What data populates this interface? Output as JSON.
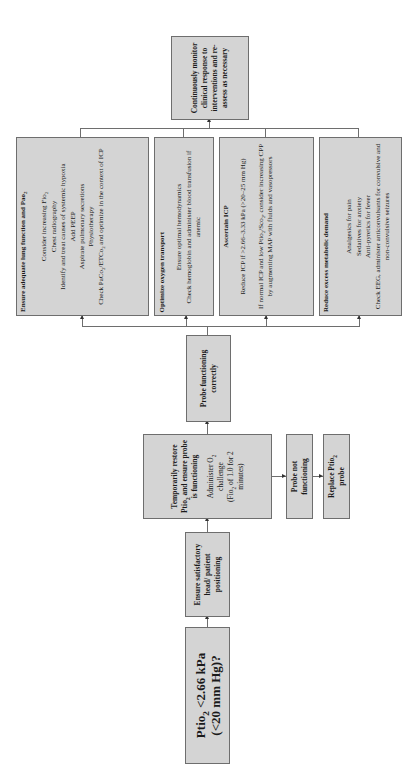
{
  "flowchart": {
    "start": {
      "line1": "Ptio",
      "line1_sub": "2",
      "line1_rest": " <2.66 kPa",
      "line2": "(<20 mm Hg)?"
    },
    "positioning": {
      "text": "Ensure satisfactory head/ patient positioning"
    },
    "restore": {
      "title_a": "Temporarily restore Ptio",
      "title_sub": "2",
      "title_b": " and ensure probe is functioning",
      "body_a": "Administer O",
      "body_sub": "2",
      "body_b": " challenge",
      "body_c": "(Fio",
      "body_c_sub": "2",
      "body_c_rest": " of 1.0 for 2 minutes)"
    },
    "probe_not_functioning": {
      "text": "Probe not functioning"
    },
    "replace_probe": {
      "text_a": "Replace Ptio",
      "text_sub": "2",
      "text_b": " probe"
    },
    "probe_ok": {
      "text": "Probe functioning correctly"
    },
    "lung": {
      "title_a": "Ensure adequate lung function and Pao",
      "title_sub": "2",
      "items": [
        {
          "a": "Consider increasing Fio",
          "sub": "2",
          "b": ""
        },
        {
          "a": "Chest radiography",
          "sub": "",
          "b": ""
        },
        {
          "a": "Identify and treat causes of systemic hypoxia",
          "sub": "",
          "b": ""
        },
        {
          "a": "Add PEEP",
          "sub": "",
          "b": ""
        },
        {
          "a": "Aspirate pulmonary secretions",
          "sub": "",
          "b": ""
        },
        {
          "a": "Physiotherapy",
          "sub": "",
          "b": ""
        }
      ],
      "last_a": "Check PaCo",
      "last_sub1": "2",
      "last_b": "/ETCo",
      "last_sub2": "2",
      "last_c": " and optimize in the context of ICP"
    },
    "oxygen": {
      "title": "Optimize oxygen transport",
      "items": [
        "Ensure optimal hemodynamics",
        "Check hemoglobin and administer blood transfusion if anemic"
      ]
    },
    "icp": {
      "title": "Ascertain ICP",
      "item1": "Reduce ICP if >2.66–3.33 kPa (>20–25 mm Hg)",
      "item2_a": "If normal ICP and low Ptio",
      "item2_sub": "2",
      "item2_b": "/Sco",
      "item2_sub2": "2",
      "item2_c": ", consider increasing CPP by augmenting MAP with fluids and vasopressors"
    },
    "metabolic": {
      "title": "Reduce excess metabolic demand",
      "items": [
        "Analgesics for pain",
        "Sedatives for anxiety",
        "Anti-pyretics for fever",
        "Check EEG, administer anticonvulsants for convulsive and non-convulsive seizures"
      ]
    },
    "monitor": {
      "text": "Continuously monitor clinical response to interventions and re-assess as necessary"
    }
  },
  "colors": {
    "box_fill": "#d4d4d4",
    "box_border": "#6e6e6e",
    "text": "#1a1a1a",
    "background": "#ffffff"
  }
}
